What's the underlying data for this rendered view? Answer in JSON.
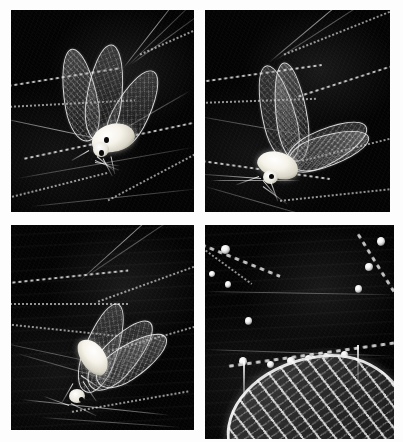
{
  "plate": {
    "title": "Insect caught in spider web — four-panel photographic plate",
    "background_color": "#fdfdfd",
    "panel_background_color": "#000000",
    "highlight_color": "#ffffff",
    "body_color": "#f6f3ea",
    "grid": {
      "rows": 2,
      "columns": 2
    }
  },
  "panels": [
    {
      "id": "panel-tl",
      "position": "top-left",
      "caption": "",
      "subject": "winged insect suspended in web, wings raised",
      "view": "full-body, wings held upright",
      "alt": "Pale-bodied lacewing-like insect entangled in a spider web, its four translucent veined wings raised above a bright white body, set against a black background crossed by dew-beaded silk strands."
    },
    {
      "id": "panel-tr",
      "position": "top-right",
      "caption": "",
      "subject": "winged insect angled downward in web",
      "view": "three-quarter, wings spread to the right",
      "alt": "The same insect seen from another angle, wings fanned out toward the upper right, body low and bright, with silk lines converging from the upper left."
    },
    {
      "id": "panel-bl",
      "position": "bottom-left",
      "caption": "",
      "subject": "winged insect hanging head-down in web",
      "view": "full-body, head down, wings back",
      "alt": "Insect hanging head-downward, wings swept back and upward, legs splayed, with horizontal banded silk and beaded strands across the dark field."
    },
    {
      "id": "panel-br",
      "position": "bottom-right",
      "caption": "",
      "subject": "macro close-up of wing venation and dew-beaded silk",
      "view": "extreme close-up detail",
      "alt": "Extreme close-up of the insect wing tip showing bright longitudinal veins and a net of cross-veins, with large dew droplets strung along spider silk above."
    }
  ]
}
